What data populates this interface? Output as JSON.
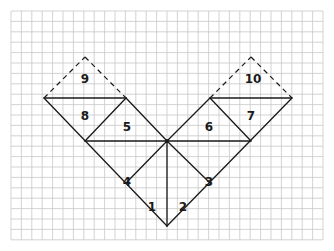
{
  "diagram": {
    "type": "tangram-style V figure on square grid",
    "grid": {
      "x0": 11,
      "y0": 11,
      "cell": 10.4,
      "cols": 30,
      "rows": 22,
      "color": "#c8c8c8"
    },
    "stroke_color": "#1a1a1a",
    "pieces": [
      {
        "id": "1",
        "label": "1",
        "pos": [
          152,
          211
        ]
      },
      {
        "id": "2",
        "label": "2",
        "pos": [
          183,
          211
        ]
      },
      {
        "id": "3",
        "label": "3",
        "pos": [
          209,
          186
        ]
      },
      {
        "id": "4",
        "label": "4",
        "pos": [
          127,
          186
        ]
      },
      {
        "id": "5",
        "label": "5",
        "pos": [
          127,
          131
        ]
      },
      {
        "id": "6",
        "label": "6",
        "pos": [
          209,
          131
        ]
      },
      {
        "id": "7",
        "label": "7",
        "pos": [
          251,
          120
        ]
      },
      {
        "id": "8",
        "label": "8",
        "pos": [
          85,
          120
        ]
      },
      {
        "id": "9",
        "label": "9",
        "pos": [
          85,
          83
        ]
      },
      {
        "id": "10",
        "label": "10",
        "pos": [
          253,
          83
        ]
      }
    ]
  }
}
